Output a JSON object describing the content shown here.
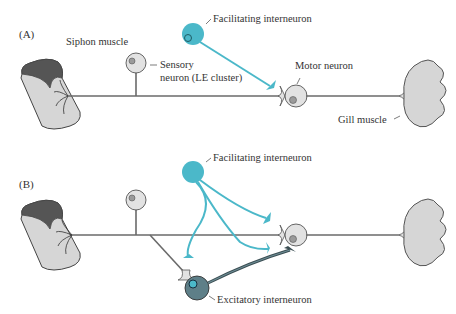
{
  "panels": [
    {
      "id": "A",
      "label": "(A)",
      "labels": {
        "siphon_muscle": "Siphon muscle",
        "sensory_neuron_line1": "Sensory",
        "sensory_neuron_line2": "neuron (LE cluster)",
        "facilitating_interneuron": "Facilitating interneuron",
        "motor_neuron": "Motor neuron",
        "gill_muscle": "Gill muscle"
      }
    },
    {
      "id": "B",
      "label": "(B)",
      "labels": {
        "facilitating_interneuron": "Facilitating interneuron",
        "excitatory_interneuron": "Excitatory interneuron"
      }
    }
  ],
  "colors": {
    "facilitating": "#4bb8c9",
    "excitatory": "#5e7f88",
    "cell_fill": "#e2e2e2",
    "muscle_fill": "#d6d6d6",
    "siphon_top": "#555555",
    "axon": "#6a6a6a"
  },
  "caption_fragment": "... (B) ... with ... flex ..."
}
